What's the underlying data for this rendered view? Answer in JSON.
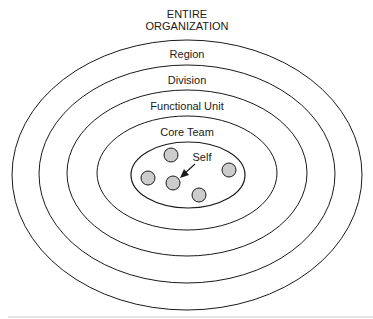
{
  "title": {
    "line1": "ENTIRE",
    "line2": "ORGANIZATION"
  },
  "rings": [
    {
      "label": "Region"
    },
    {
      "label": "Division"
    },
    {
      "label": "Functional Unit"
    },
    {
      "label": "Core Team"
    }
  ],
  "inner": {
    "self_label": "Self",
    "member_count": 5
  },
  "colors": {
    "stroke": "#1a1a1a",
    "member_fill": "#cccccc"
  }
}
